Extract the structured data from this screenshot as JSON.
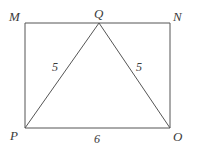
{
  "figure": {
    "kind": "geometry-diagram",
    "stroke_color": "#555555",
    "label_color": "#3b3b3b",
    "background_color": "#ffffff",
    "stroke_width": 1
  },
  "vertices": [
    {
      "id": "M",
      "label": "M",
      "x": 25,
      "y": 23
    },
    {
      "id": "Q",
      "label": "Q",
      "x": 99,
      "y": 23
    },
    {
      "id": "N",
      "label": "N",
      "x": 170,
      "y": 23
    },
    {
      "id": "P",
      "label": "P",
      "x": 25,
      "y": 128
    },
    {
      "id": "O",
      "label": "O",
      "x": 170,
      "y": 128
    }
  ],
  "edges": [
    {
      "id": "MN",
      "from": "M",
      "to": "N",
      "kind": "rectangle-side"
    },
    {
      "id": "NO",
      "from": "N",
      "to": "O",
      "kind": "rectangle-side"
    },
    {
      "id": "OP",
      "from": "O",
      "to": "P",
      "kind": "rectangle-side"
    },
    {
      "id": "PM",
      "from": "P",
      "to": "M",
      "kind": "rectangle-side"
    },
    {
      "id": "PQ",
      "from": "P",
      "to": "Q",
      "kind": "triangle-side"
    },
    {
      "id": "QO",
      "from": "Q",
      "to": "O",
      "kind": "triangle-side"
    }
  ],
  "measures": {
    "pq": "5",
    "qo": "5",
    "po": "6"
  },
  "chart_data": {
    "type": "diagram",
    "title": "",
    "shapes": [
      {
        "name": "rectangle-MNOP",
        "points": [
          [
            25,
            23
          ],
          [
            170,
            23
          ],
          [
            170,
            128
          ],
          [
            25,
            128
          ]
        ],
        "closed": true
      },
      {
        "name": "triangle-PQO",
        "points": [
          [
            25,
            128
          ],
          [
            99,
            23
          ],
          [
            170,
            128
          ]
        ],
        "closed": false
      }
    ],
    "labels": [
      {
        "text": "M",
        "x": 9,
        "y": 10
      },
      {
        "text": "Q",
        "x": 94,
        "y": 7
      },
      {
        "text": "N",
        "x": 173,
        "y": 10
      },
      {
        "text": "P",
        "x": 10,
        "y": 129
      },
      {
        "text": "O",
        "x": 173,
        "y": 130
      },
      {
        "text": "5",
        "x": 52,
        "y": 61
      },
      {
        "text": "5",
        "x": 136,
        "y": 61
      },
      {
        "text": "6",
        "x": 94,
        "y": 133
      }
    ]
  }
}
